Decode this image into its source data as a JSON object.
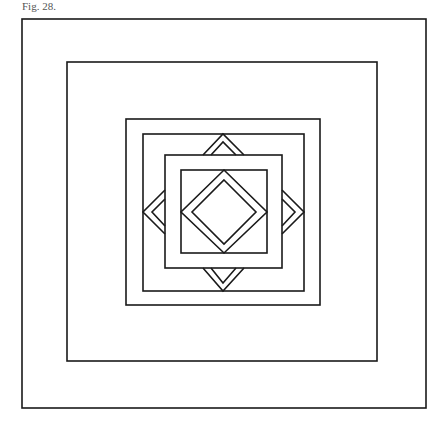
{
  "caption": "Fig. 28.",
  "style": {
    "stroke": "#1a1a1a",
    "stroke_width": 1.6,
    "background": "#ffffff"
  },
  "squares": [
    {
      "name": "square-1-outer",
      "x": 22,
      "y": 19,
      "w": 404,
      "h": 389
    },
    {
      "name": "square-2",
      "x": 67,
      "y": 62,
      "w": 310,
      "h": 299
    },
    {
      "name": "square-3",
      "x": 126,
      "y": 119,
      "w": 194,
      "h": 186
    },
    {
      "name": "square-4",
      "x": 143,
      "y": 134,
      "w": 161,
      "h": 157
    },
    {
      "name": "square-5",
      "x": 165,
      "y": 155,
      "w": 117,
      "h": 113
    },
    {
      "name": "square-6-inner",
      "x": 181,
      "y": 170,
      "w": 86,
      "h": 83
    }
  ],
  "diamonds": [
    {
      "name": "diamond-outer",
      "points": "224,170 267,212 224,253 181,212"
    },
    {
      "name": "diamond-inner",
      "points": "224,180 256,212 224,244 192,212"
    }
  ],
  "chevrons": [
    {
      "name": "chevron-top-outer",
      "points": "203,155 223,134 244,155"
    },
    {
      "name": "chevron-top-inner",
      "points": "211,155 223,142 236,155"
    },
    {
      "name": "chevron-bottom-outer",
      "points": "203,268 223,291 244,268"
    },
    {
      "name": "chevron-bottom-inner",
      "points": "211,268 223,283 236,268"
    },
    {
      "name": "chevron-left-outer",
      "points": "165,190 143,212 165,234"
    },
    {
      "name": "chevron-left-inner",
      "points": "165,199 152,212 165,226"
    },
    {
      "name": "chevron-right-outer",
      "points": "282,190 304,212 282,234"
    },
    {
      "name": "chevron-right-inner",
      "points": "282,199 295,212 282,226"
    }
  ]
}
